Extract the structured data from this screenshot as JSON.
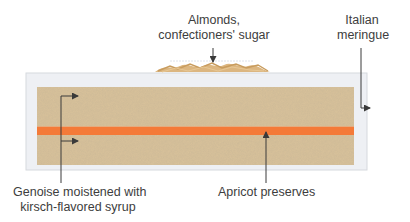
{
  "diagram": {
    "type": "cake-cross-section",
    "colors": {
      "meringue": "#eef0f4",
      "meringue_border": "#d6d9de",
      "genoise": "#d9c29a",
      "apricot": "#f47a38",
      "almonds": "#dcb680",
      "leader": "#3a3a3a"
    },
    "labels": {
      "almonds": {
        "line1": "Almonds,",
        "line2": "confectioners' sugar"
      },
      "meringue": {
        "line1": "Italian",
        "line2": "meringue"
      },
      "genoise": {
        "line1": "Genoise moistened with",
        "line2": "kirsch-flavored syrup"
      },
      "apricot": {
        "line1": "Apricot preserves"
      }
    },
    "layers": [
      {
        "name": "Almonds, confectioners' sugar",
        "position": "top garnish"
      },
      {
        "name": "Italian meringue",
        "position": "outer coating"
      },
      {
        "name": "Genoise moistened with kirsch-flavored syrup",
        "position": "upper and lower cake layers"
      },
      {
        "name": "Apricot preserves",
        "position": "middle filling"
      }
    ]
  }
}
